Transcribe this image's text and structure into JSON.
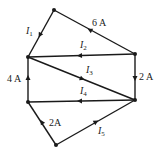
{
  "diagram": {
    "type": "circuit-node-diagram",
    "nodes": [
      {
        "id": "top",
        "x": 54,
        "y": 10
      },
      {
        "id": "left-upper",
        "x": 28,
        "y": 57
      },
      {
        "id": "right-upper",
        "x": 135,
        "y": 54
      },
      {
        "id": "left-lower",
        "x": 28,
        "y": 102
      },
      {
        "id": "right-lower",
        "x": 135,
        "y": 100
      },
      {
        "id": "bottom",
        "x": 56,
        "y": 145
      }
    ],
    "branches": [
      {
        "id": "I1",
        "label_var": "I",
        "label_sub": "1",
        "from": "top",
        "to": "left-upper"
      },
      {
        "id": "6A",
        "label": "6 A",
        "from": "right-upper",
        "to": "top"
      },
      {
        "id": "I2",
        "label_var": "I",
        "label_sub": "2",
        "from": "right-upper",
        "to": "left-upper"
      },
      {
        "id": "2A-right",
        "label": "2 A",
        "from": "right-upper",
        "to": "right-lower"
      },
      {
        "id": "I3",
        "label_var": "I",
        "label_sub": "3",
        "from": "left-upper",
        "to": "right-lower"
      },
      {
        "id": "4A",
        "label": "4 A",
        "from": "left-lower",
        "to": "left-upper"
      },
      {
        "id": "I4",
        "label_var": "I",
        "label_sub": "4",
        "from": "right-lower",
        "to": "left-lower"
      },
      {
        "id": "2A-bottom",
        "label": "2A",
        "from": "bottom",
        "to": "left-lower"
      },
      {
        "id": "I5",
        "label_var": "I",
        "label_sub": "5",
        "from": "bottom",
        "to": "right-lower"
      }
    ]
  },
  "labels": {
    "i1": {
      "var": "I",
      "sub": "1"
    },
    "i2": {
      "var": "I",
      "sub": "2"
    },
    "i3": {
      "var": "I",
      "sub": "3"
    },
    "i4": {
      "var": "I",
      "sub": "4"
    },
    "i5": {
      "var": "I",
      "sub": "5"
    },
    "six_a": "6 A",
    "two_a_right": "2 A",
    "four_a": "4 A",
    "two_a_bottom": "2A"
  },
  "colors": {
    "line": "#1a1a1a",
    "background": "#ffffff"
  }
}
